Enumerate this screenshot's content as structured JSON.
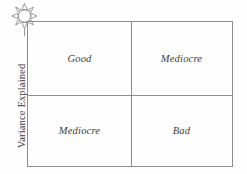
{
  "figure": {
    "name": "variance-explained-quadrant-matrix",
    "axis": {
      "y_label": "Variance Explained"
    },
    "icon": {
      "name": "sun-burst-icon",
      "rays": 8,
      "stroke_color": "#8d8d8d"
    },
    "matrix": {
      "border_color": "#8d8d8d",
      "quadrants": [
        {
          "position": "top-left",
          "label": "Good"
        },
        {
          "position": "top-right",
          "label": "Mediocre"
        },
        {
          "position": "bottom-left",
          "label": "Mediocre"
        },
        {
          "position": "bottom-right",
          "label": "Bad"
        }
      ]
    },
    "colors": {
      "line": "#8d8d8d",
      "text": "#3c3c3c",
      "background": "#fefefe"
    }
  }
}
